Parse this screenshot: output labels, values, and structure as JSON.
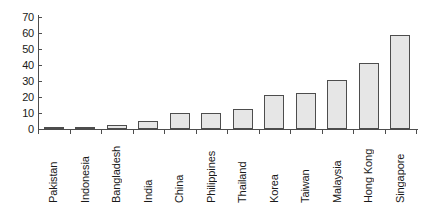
{
  "chart_data": {
    "type": "bar",
    "title": "",
    "xlabel": "",
    "ylabel": "",
    "ylim": [
      0,
      70
    ],
    "yticks": [
      0,
      10,
      20,
      30,
      40,
      50,
      60,
      70
    ],
    "grid": false,
    "legend": null,
    "categories": [
      "Pakistan",
      "Indonesia",
      "Bangladesh",
      "India",
      "China",
      "Philippines",
      "Thailand",
      "Korea",
      "Taiwan",
      "Malaysia",
      "Hong Kong",
      "Singapore"
    ],
    "values": [
      0.8,
      1.5,
      2.2,
      4.8,
      10.3,
      9.8,
      12.5,
      21.5,
      22.3,
      30.5,
      41.0,
      59.0
    ],
    "bar_fill_color": "#e6e6e6",
    "bar_border_color": "#4d4d4d",
    "axis_color": "#4d4d4d",
    "background_color": "#ffffff"
  },
  "axis": {
    "y_tick_labels": [
      "70",
      "60",
      "50",
      "40",
      "30",
      "20",
      "10",
      "0"
    ]
  }
}
